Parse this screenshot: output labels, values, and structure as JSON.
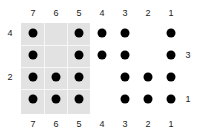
{
  "figure": {
    "name": "dot-matrix-diagram",
    "width": 202,
    "height": 139,
    "background_color": "#ffffff",
    "dot_color": "#000000",
    "shade_color": "#e2e2e2",
    "gridline_color": "#f7f7f7",
    "label_color": "#1a1a1a"
  },
  "columns": {
    "labels_top": [
      "7",
      "6",
      "5",
      "4",
      "3",
      "2",
      "1"
    ],
    "labels_bottom": [
      "7",
      "6",
      "5",
      "4",
      "3",
      "2",
      "1"
    ],
    "x": [
      33,
      56,
      79,
      102,
      125,
      148,
      171
    ],
    "ids": [
      7,
      6,
      5,
      4,
      3,
      2,
      1
    ]
  },
  "rows": {
    "y": [
      33,
      55,
      77,
      99
    ],
    "labels_left": [
      "4",
      "",
      "2",
      ""
    ],
    "labels_right": [
      "",
      "3",
      "",
      "1"
    ]
  },
  "label_positions": {
    "top_y": 13,
    "bottom_y": 124,
    "left_x": 10,
    "right_x": 188
  },
  "shaded_region": {
    "x": 21,
    "y": 23,
    "width": 69,
    "height": 91,
    "covers_columns": [
      "7",
      "6",
      "5"
    ],
    "covers_rows": [
      "4",
      "3",
      "2",
      "1"
    ],
    "vertical_gridlines_x": [
      44,
      67
    ],
    "horizontal_gridlines_y": [
      45,
      67,
      89
    ]
  },
  "chart_data": {
    "type": "scatter",
    "title": "",
    "xlabel": "",
    "ylabel": "",
    "x_categories": [
      "7",
      "6",
      "5",
      "4",
      "3",
      "2",
      "1"
    ],
    "y_categories": [
      "4",
      "3",
      "2",
      "1"
    ],
    "grid": false,
    "legend": "none",
    "matrix": [
      {
        "row": "4",
        "cells": [
          1,
          0,
          1,
          1,
          1,
          0,
          1
        ]
      },
      {
        "row": "3",
        "cells": [
          1,
          0,
          1,
          1,
          1,
          0,
          1
        ]
      },
      {
        "row": "2",
        "cells": [
          1,
          1,
          1,
          0,
          1,
          1,
          1
        ]
      },
      {
        "row": "1",
        "cells": [
          1,
          1,
          1,
          0,
          1,
          1,
          1
        ]
      }
    ],
    "points": [
      {
        "x": "7",
        "y": "4"
      },
      {
        "x": "5",
        "y": "4"
      },
      {
        "x": "4",
        "y": "4"
      },
      {
        "x": "3",
        "y": "4"
      },
      {
        "x": "1",
        "y": "4"
      },
      {
        "x": "7",
        "y": "3"
      },
      {
        "x": "5",
        "y": "3"
      },
      {
        "x": "4",
        "y": "3"
      },
      {
        "x": "3",
        "y": "3"
      },
      {
        "x": "1",
        "y": "3"
      },
      {
        "x": "7",
        "y": "2"
      },
      {
        "x": "6",
        "y": "2"
      },
      {
        "x": "5",
        "y": "2"
      },
      {
        "x": "3",
        "y": "2"
      },
      {
        "x": "2",
        "y": "2"
      },
      {
        "x": "1",
        "y": "2"
      },
      {
        "x": "7",
        "y": "1"
      },
      {
        "x": "6",
        "y": "1"
      },
      {
        "x": "5",
        "y": "1"
      },
      {
        "x": "3",
        "y": "1"
      },
      {
        "x": "2",
        "y": "1"
      },
      {
        "x": "1",
        "y": "1"
      }
    ]
  }
}
